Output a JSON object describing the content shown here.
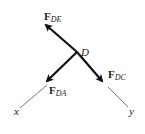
{
  "diagram": {
    "type": "free-body-diagram",
    "joint": {
      "label": "D",
      "x": 77,
      "y": 52
    },
    "forces": [
      {
        "name": "F_DE",
        "symbol": "F",
        "subscript": "DE",
        "tip": [
          45,
          24
        ],
        "label_pos": [
          36,
          20
        ]
      },
      {
        "name": "F_DA",
        "symbol": "F",
        "subscript": "DA",
        "tip": [
          46,
          82
        ],
        "label_pos": [
          50,
          95
        ]
      },
      {
        "name": "F_DC",
        "symbol": "F",
        "subscript": "DC",
        "tip": [
          103,
          82
        ],
        "label_pos": [
          108,
          78
        ]
      }
    ],
    "axes": [
      {
        "label": "x",
        "from": [
          47,
          85
        ],
        "to": [
          20,
          108
        ],
        "label_pos": [
          14,
          116
        ]
      },
      {
        "label": "y",
        "from": [
          108,
          87
        ],
        "to": [
          128,
          107
        ],
        "label_pos": [
          130,
          116
        ]
      }
    ],
    "colors": {
      "arrow": "#111111",
      "axis": "#555555",
      "text": "#222222"
    }
  }
}
